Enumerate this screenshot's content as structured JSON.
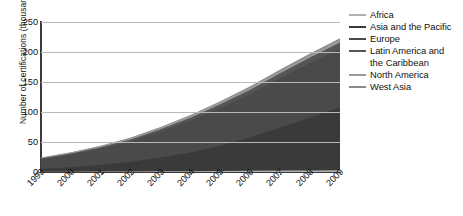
{
  "chart_data": {
    "type": "area",
    "stacked": true,
    "title": "",
    "xlabel": "",
    "ylabel": "Number of certifications (thousands)",
    "ylim": [
      0,
      250
    ],
    "yticks": [
      0,
      50,
      100,
      150,
      200,
      250
    ],
    "grid": true,
    "legend_position": "right",
    "categories": [
      "1999",
      "2000",
      "2001",
      "2002",
      "2003",
      "2004",
      "2005",
      "2006",
      "2007",
      "2008",
      "2009"
    ],
    "series": [
      {
        "name": "Africa",
        "color": "#b0b0b0",
        "values": [
          0.3,
          0.5,
          0.7,
          0.9,
          1.1,
          1.4,
          1.7,
          2.0,
          2.3,
          2.6,
          2.9
        ]
      },
      {
        "name": "Asia and the Pacific",
        "color": "#3a3a3a",
        "values": [
          5.0,
          7.5,
          11.0,
          16.0,
          23.0,
          31.0,
          42.0,
          56.0,
          72.0,
          88.0,
          105.0
        ]
      },
      {
        "name": "Europe",
        "color": "#4a4a4a",
        "values": [
          16.0,
          21.0,
          27.0,
          34.0,
          43.0,
          53.0,
          63.0,
          72.0,
          82.0,
          91.0,
          98.0
        ]
      },
      {
        "name": "Latin America and the Caribbean",
        "color": "#555555",
        "values": [
          1.2,
          1.8,
          2.5,
          3.3,
          4.2,
          5.2,
          6.2,
          7.2,
          8.2,
          9.2,
          10.0
        ]
      },
      {
        "name": "North America",
        "color": "#9a9a9a",
        "values": [
          1.4,
          1.8,
          2.2,
          2.6,
          3.0,
          3.4,
          3.8,
          4.2,
          4.4,
          4.6,
          4.7
        ]
      },
      {
        "name": "West Asia",
        "color": "#8a8a8a",
        "values": [
          0.2,
          0.3,
          0.4,
          0.6,
          0.8,
          1.0,
          1.3,
          1.6,
          1.9,
          2.2,
          2.5
        ]
      }
    ],
    "totals": [
      24.1,
      32.9,
      43.8,
      57.4,
      75.1,
      95.0,
      118.0,
      143.0,
      170.8,
      197.6,
      223.1
    ]
  },
  "axis": {
    "ylabel": "Number of certifications (thousands)",
    "ytick_labels": [
      "0",
      "50",
      "100",
      "150",
      "200",
      "250"
    ],
    "xtick_labels": [
      "1999",
      "2000",
      "2001",
      "2002",
      "2003",
      "2004",
      "2005",
      "2006",
      "2007",
      "2008",
      "2009"
    ]
  },
  "legend": {
    "items": [
      {
        "label": "Africa",
        "color": "#b0b0b0",
        "continuation": ""
      },
      {
        "label": "Asia and the Pacific",
        "color": "#3a3a3a",
        "continuation": ""
      },
      {
        "label": "Europe",
        "color": "#4a4a4a",
        "continuation": ""
      },
      {
        "label": "Latin America and",
        "color": "#555555",
        "continuation": "the Caribbean"
      },
      {
        "label": "North America",
        "color": "#9a9a9a",
        "continuation": ""
      },
      {
        "label": "West Asia",
        "color": "#8a8a8a",
        "continuation": ""
      }
    ]
  }
}
